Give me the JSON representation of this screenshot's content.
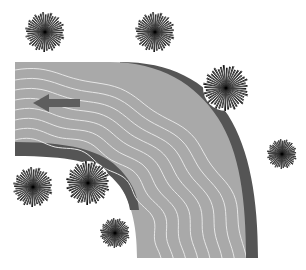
{
  "diagram": {
    "background": "#ffffff",
    "river": {
      "water_color": "#a9a9a9",
      "bank_color": "#555555",
      "wave_color": "#e6e6e6"
    },
    "flow_arrow": {
      "direction": "left",
      "color": "#5e5e5e",
      "icon": "arrow-left-icon"
    },
    "trees": [
      {
        "id": "tree-1",
        "cx": 45,
        "cy": 32,
        "r": 20
      },
      {
        "id": "tree-2",
        "cx": 155,
        "cy": 32,
        "r": 20
      },
      {
        "id": "tree-3",
        "cx": 226,
        "cy": 88,
        "r": 23
      },
      {
        "id": "tree-4",
        "cx": 282,
        "cy": 154,
        "r": 15
      },
      {
        "id": "tree-5",
        "cx": 33,
        "cy": 187,
        "r": 20
      },
      {
        "id": "tree-6",
        "cx": 88,
        "cy": 183,
        "r": 22
      },
      {
        "id": "tree-7",
        "cx": 115,
        "cy": 233,
        "r": 15
      }
    ]
  }
}
